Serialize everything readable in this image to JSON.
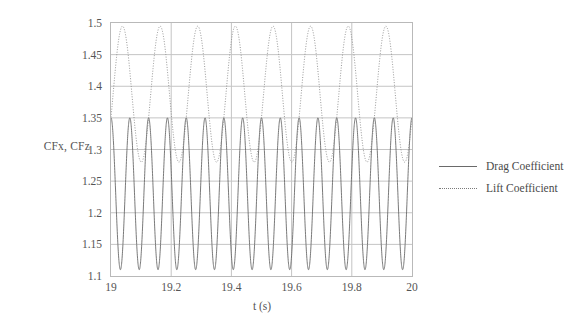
{
  "chart_data": {
    "type": "line",
    "title": "",
    "xlabel": "t (s)",
    "ylabel": "CFx, CFz",
    "xlim": [
      19,
      20
    ],
    "ylim": [
      1.1,
      1.5
    ],
    "xticks": [
      "19",
      "19.2",
      "19.4",
      "19.6",
      "19.8",
      "20"
    ],
    "xtick_values": [
      19,
      19.2,
      19.4,
      19.6,
      19.8,
      20
    ],
    "yticks": [
      "1.1",
      "1.15",
      "1.2",
      "1.25",
      "1.3",
      "1.35",
      "1.4",
      "1.45",
      "1.5"
    ],
    "ytick_values": [
      1.1,
      1.15,
      1.2,
      1.25,
      1.3,
      1.35,
      1.4,
      1.45,
      1.5
    ],
    "grid": "horizontal-and-major-vertical",
    "legend_position": "right",
    "series": [
      {
        "name": "Drag Coefficient",
        "style": "solid",
        "color": "#6a6a6a",
        "mean": 1.23,
        "amplitude": 0.12,
        "frequency_hz": 16,
        "phase_deg": 90,
        "min": 1.11,
        "max": 1.35
      },
      {
        "name": "Lift Coefficient",
        "style": "dotted",
        "color": "#8a8a8a",
        "mean": 1.3875,
        "amplitude": 0.1075,
        "frequency_hz": 8,
        "phase_deg": -20,
        "min": 1.28,
        "max": 1.495
      }
    ]
  },
  "axes": {
    "ylabel_title": "CFx, CFz",
    "xlabel_title": "t (s)"
  },
  "legend": {
    "items": [
      {
        "label": "Drag Coefficient"
      },
      {
        "label": "Lift Coefficient"
      }
    ]
  }
}
